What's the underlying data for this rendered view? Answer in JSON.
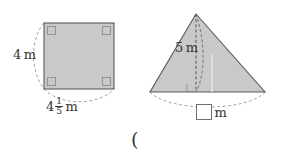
{
  "page": {
    "background_color": "#ffffff",
    "figure_fill_color": "#c9c9c9",
    "figure_stroke_color": "#5a5a5a",
    "dash_color": "#9a9a9a",
    "text_color": "#333333"
  },
  "square_figure": {
    "name": "square",
    "height_label": "4",
    "height_unit": "m",
    "base_whole": "4",
    "base_fraction_numerator": "1",
    "base_fraction_denominator": "5",
    "base_unit": "m",
    "right_angle_markers": 4
  },
  "triangle_figure": {
    "name": "triangle",
    "height_label": "5",
    "height_unit": "m",
    "base_value": "",
    "base_unit": "m",
    "right_angle_markers": 1
  },
  "stray_glyph": {
    "text": "("
  }
}
